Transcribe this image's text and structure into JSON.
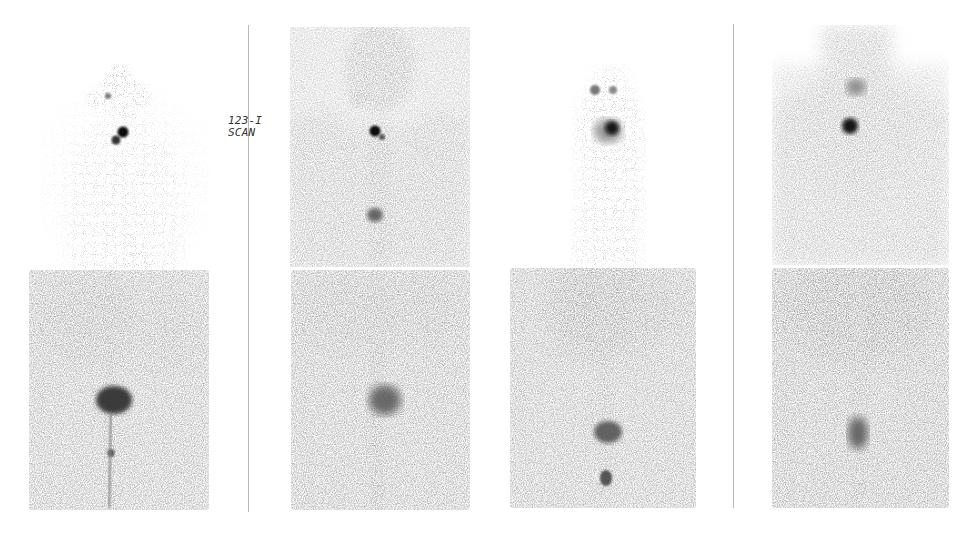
{
  "figure": {
    "label_lines": [
      "123-I",
      "SCAN"
    ],
    "colors": {
      "background": "#ffffff",
      "divider": "#b8b8b8",
      "tissue_light": "#c4c4c4",
      "tissue_mid": "#a8a8a8",
      "hotspot": "#111111",
      "label": "#333333"
    },
    "dividers": [
      {
        "x": 248,
        "y_top": 25,
        "y_bottom": 512
      },
      {
        "x": 733,
        "y_top": 24,
        "y_bottom": 508
      }
    ],
    "columns": [
      {
        "name": "scan-1",
        "upper": {
          "type": "sparse-upper-body",
          "hotspots": [
            "neck-double-focus"
          ]
        },
        "lower": {
          "type": "abdomen-pelvis",
          "hotspots": [
            "bladder-dark",
            "small-focus-below"
          ]
        }
      },
      {
        "name": "scan-2",
        "upper": {
          "type": "dense-upper-body",
          "hotspots": [
            "neck-focus",
            "stomach-faint"
          ]
        },
        "lower": {
          "type": "abdomen-pelvis",
          "hotspots": [
            "bladder-moderate"
          ]
        }
      },
      {
        "name": "scan-3",
        "upper": {
          "type": "sparse-upper-body",
          "hotspots": [
            "salivary-left",
            "salivary-right",
            "neck-focus"
          ]
        },
        "lower": {
          "type": "abdomen-pelvis",
          "hotspots": [
            "liver-diffuse",
            "bladder-moderate",
            "small-focus-below"
          ]
        }
      },
      {
        "name": "scan-4",
        "upper": {
          "type": "dense-upper-body",
          "hotspots": [
            "salivary-faint",
            "neck-focus"
          ]
        },
        "lower": {
          "type": "abdomen-pelvis",
          "hotspots": [
            "liver-diffuse",
            "bladder-faint"
          ]
        }
      }
    ]
  }
}
